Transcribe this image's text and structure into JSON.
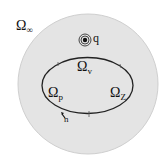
{
  "diagram": {
    "colors": {
      "background": "#ffffff",
      "disc_fill": "#e4e4e4",
      "disc_edge": "#cfcfcf",
      "curve": "#222222",
      "text": "#111111"
    },
    "regions": {
      "outer": {
        "symbol": "Ω",
        "subscript": "∞"
      },
      "top": {
        "symbol": "Ω",
        "subscript": "v"
      },
      "left": {
        "symbol": "Ω",
        "subscript": "p"
      },
      "right": {
        "symbol": "Ω",
        "subscript": "Z"
      }
    },
    "point_charge": {
      "label": "q",
      "icon": "concentric-circle-source"
    },
    "normal": {
      "label": "n",
      "icon": "arrow-normal"
    }
  }
}
